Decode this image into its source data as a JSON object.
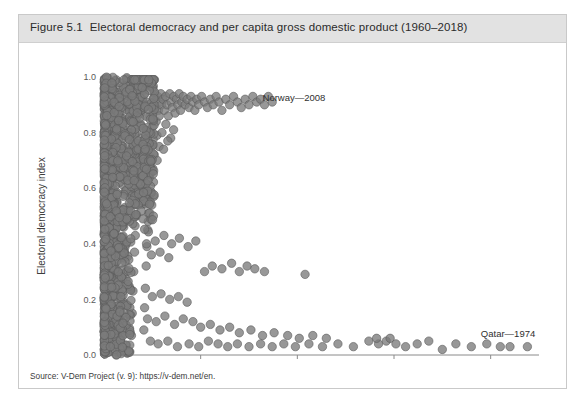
{
  "figure": {
    "number": "Figure 5.1",
    "title": "Electoral democracy and per capita gross domestic product (1960–2018)",
    "source": "Source: V-Dem Project (v. 9): https://v-dem.net/en."
  },
  "colors": {
    "header_band": "#e2e2e2",
    "frame_border": "#c9c9c9",
    "marker_fill": "#7b7b7b",
    "marker_stroke": "#5a5a5a",
    "axis": "#8a8a8a",
    "tick_text": "#595959"
  },
  "chart_data": {
    "type": "scatter",
    "title": "Electoral democracy and per capita gross domestic product (1960–2018)",
    "xlabel": "GDP per capita",
    "ylabel": "Electoral democracy index",
    "xlim": [
      0,
      225000
    ],
    "ylim": [
      0.0,
      1.0
    ],
    "xticks": [
      0,
      50000,
      100000,
      150000,
      200000
    ],
    "xtick_labels": [
      "0",
      "50,000",
      "100,000",
      "150,000",
      "200,000"
    ],
    "yticks": [
      0.0,
      0.2,
      0.4,
      0.6,
      0.8,
      1.0
    ],
    "ytick_labels": [
      "0.0",
      "0.2",
      "0.4",
      "0.6",
      "0.8",
      "1.0"
    ],
    "grid": false,
    "legend": null,
    "marker_radius_px": 4.2,
    "marker_opacity": 0.78,
    "annotations": [
      {
        "text": "Norway—2008",
        "x": 82000,
        "y": 0.925,
        "anchor": "start"
      },
      {
        "text": "Qatar—1974",
        "x": 209000,
        "y": 0.075,
        "anchor": "middle"
      }
    ],
    "points": [
      [
        1200,
        0.04
      ],
      [
        900,
        0.08
      ],
      [
        1500,
        0.12
      ],
      [
        800,
        0.16
      ],
      [
        2100,
        0.06
      ],
      [
        1700,
        0.21
      ],
      [
        1100,
        0.27
      ],
      [
        2400,
        0.33
      ],
      [
        600,
        0.38
      ],
      [
        1900,
        0.44
      ],
      [
        1300,
        0.49
      ],
      [
        2600,
        0.55
      ],
      [
        1000,
        0.61
      ],
      [
        2200,
        0.66
      ],
      [
        1600,
        0.72
      ],
      [
        3000,
        0.77
      ],
      [
        700,
        0.83
      ],
      [
        2800,
        0.88
      ],
      [
        1400,
        0.92
      ],
      [
        2000,
        0.95
      ],
      [
        3400,
        0.1
      ],
      [
        3800,
        0.18
      ],
      [
        4200,
        0.25
      ],
      [
        3600,
        0.31
      ],
      [
        4600,
        0.36
      ],
      [
        3200,
        0.42
      ],
      [
        5000,
        0.47
      ],
      [
        4400,
        0.52
      ],
      [
        5400,
        0.58
      ],
      [
        4000,
        0.63
      ],
      [
        5800,
        0.68
      ],
      [
        4800,
        0.74
      ],
      [
        6200,
        0.79
      ],
      [
        5200,
        0.84
      ],
      [
        6600,
        0.89
      ],
      [
        5600,
        0.93
      ],
      [
        7000,
        0.96
      ],
      [
        6000,
        0.9
      ],
      [
        7400,
        0.86
      ],
      [
        6400,
        0.81
      ],
      [
        7800,
        0.05
      ],
      [
        8200,
        0.13
      ],
      [
        8600,
        0.2
      ],
      [
        9000,
        0.28
      ],
      [
        9400,
        0.35
      ],
      [
        9800,
        0.41
      ],
      [
        10200,
        0.46
      ],
      [
        10600,
        0.53
      ],
      [
        11000,
        0.59
      ],
      [
        11400,
        0.64
      ],
      [
        11800,
        0.7
      ],
      [
        12200,
        0.75
      ],
      [
        12600,
        0.8
      ],
      [
        13000,
        0.85
      ],
      [
        13400,
        0.9
      ],
      [
        13800,
        0.94
      ],
      [
        14200,
        0.07
      ],
      [
        14600,
        0.15
      ],
      [
        15000,
        0.23
      ],
      [
        15400,
        0.3
      ],
      [
        15800,
        0.37
      ],
      [
        16200,
        0.43
      ],
      [
        16600,
        0.5
      ],
      [
        17000,
        0.56
      ],
      [
        17400,
        0.62
      ],
      [
        17800,
        0.67
      ],
      [
        18200,
        0.73
      ],
      [
        18600,
        0.78
      ],
      [
        19000,
        0.83
      ],
      [
        19400,
        0.88
      ],
      [
        19800,
        0.92
      ],
      [
        20200,
        0.95
      ],
      [
        20600,
        0.09
      ],
      [
        21000,
        0.17
      ],
      [
        21400,
        0.24
      ],
      [
        21800,
        0.32
      ],
      [
        22200,
        0.39
      ],
      [
        22600,
        0.45
      ],
      [
        23000,
        0.51
      ],
      [
        23400,
        0.57
      ],
      [
        23800,
        0.65
      ],
      [
        24200,
        0.71
      ],
      [
        24600,
        0.76
      ],
      [
        25000,
        0.82
      ],
      [
        25400,
        0.87
      ],
      [
        25800,
        0.91
      ],
      [
        26200,
        0.94
      ],
      [
        26600,
        0.89
      ],
      [
        27000,
        0.84
      ],
      [
        27400,
        0.79
      ],
      [
        27800,
        0.93
      ],
      [
        28200,
        0.88
      ],
      [
        28600,
        0.86
      ],
      [
        29000,
        0.91
      ],
      [
        29400,
        0.94
      ],
      [
        29800,
        0.9
      ],
      [
        30500,
        0.92
      ],
      [
        31200,
        0.88
      ],
      [
        31900,
        0.93
      ],
      [
        32600,
        0.9
      ],
      [
        33300,
        0.86
      ],
      [
        34000,
        0.94
      ],
      [
        34700,
        0.91
      ],
      [
        35400,
        0.89
      ],
      [
        36100,
        0.93
      ],
      [
        36800,
        0.87
      ],
      [
        37500,
        0.92
      ],
      [
        38200,
        0.9
      ],
      [
        38900,
        0.94
      ],
      [
        39600,
        0.88
      ],
      [
        40300,
        0.91
      ],
      [
        41000,
        0.93
      ],
      [
        42000,
        0.9
      ],
      [
        43000,
        0.92
      ],
      [
        44000,
        0.89
      ],
      [
        45000,
        0.93
      ],
      [
        46000,
        0.91
      ],
      [
        47000,
        0.88
      ],
      [
        48000,
        0.92
      ],
      [
        49000,
        0.9
      ],
      [
        50500,
        0.93
      ],
      [
        52000,
        0.91
      ],
      [
        53500,
        0.89
      ],
      [
        55000,
        0.92
      ],
      [
        56500,
        0.9
      ],
      [
        58000,
        0.93
      ],
      [
        59500,
        0.91
      ],
      [
        61000,
        0.88
      ],
      [
        63000,
        0.92
      ],
      [
        65000,
        0.9
      ],
      [
        67000,
        0.93
      ],
      [
        69000,
        0.91
      ],
      [
        71000,
        0.89
      ],
      [
        73000,
        0.92
      ],
      [
        75000,
        0.9
      ],
      [
        77000,
        0.93
      ],
      [
        79000,
        0.91
      ],
      [
        81000,
        0.92
      ],
      [
        83000,
        0.9
      ],
      [
        85000,
        0.93
      ],
      [
        87000,
        0.91
      ],
      [
        30000,
        0.8
      ],
      [
        32000,
        0.83
      ],
      [
        34500,
        0.78
      ],
      [
        36000,
        0.81
      ],
      [
        28500,
        0.75
      ],
      [
        26000,
        0.72
      ],
      [
        24000,
        0.68
      ],
      [
        27500,
        0.7
      ],
      [
        30800,
        0.74
      ],
      [
        33000,
        0.77
      ],
      [
        22000,
        0.4
      ],
      [
        26500,
        0.41
      ],
      [
        31000,
        0.43
      ],
      [
        35000,
        0.4
      ],
      [
        39000,
        0.42
      ],
      [
        43500,
        0.39
      ],
      [
        47500,
        0.41
      ],
      [
        24500,
        0.36
      ],
      [
        29000,
        0.37
      ],
      [
        33500,
        0.35
      ],
      [
        52000,
        0.3
      ],
      [
        56000,
        0.32
      ],
      [
        61000,
        0.31
      ],
      [
        66000,
        0.33
      ],
      [
        70000,
        0.3
      ],
      [
        74000,
        0.32
      ],
      [
        78000,
        0.31
      ],
      [
        83000,
        0.3
      ],
      [
        104000,
        0.29
      ],
      [
        25000,
        0.21
      ],
      [
        29500,
        0.22
      ],
      [
        34000,
        0.2
      ],
      [
        38500,
        0.21
      ],
      [
        43000,
        0.19
      ],
      [
        22500,
        0.13
      ],
      [
        27000,
        0.12
      ],
      [
        31500,
        0.14
      ],
      [
        36500,
        0.11
      ],
      [
        41000,
        0.13
      ],
      [
        46000,
        0.12
      ],
      [
        50000,
        0.1
      ],
      [
        55000,
        0.11
      ],
      [
        60000,
        0.09
      ],
      [
        65000,
        0.1
      ],
      [
        70000,
        0.08
      ],
      [
        76000,
        0.09
      ],
      [
        82000,
        0.07
      ],
      [
        88000,
        0.08
      ],
      [
        95000,
        0.07
      ],
      [
        101000,
        0.06
      ],
      [
        108000,
        0.07
      ],
      [
        115000,
        0.06
      ],
      [
        24000,
        0.05
      ],
      [
        28000,
        0.04
      ],
      [
        33000,
        0.05
      ],
      [
        38000,
        0.03
      ],
      [
        44000,
        0.04
      ],
      [
        49000,
        0.03
      ],
      [
        54000,
        0.05
      ],
      [
        59000,
        0.04
      ],
      [
        64000,
        0.03
      ],
      [
        69000,
        0.04
      ],
      [
        75000,
        0.03
      ],
      [
        81000,
        0.04
      ],
      [
        87000,
        0.03
      ],
      [
        93000,
        0.04
      ],
      [
        99000,
        0.03
      ],
      [
        106000,
        0.04
      ],
      [
        113000,
        0.03
      ],
      [
        121000,
        0.04
      ],
      [
        129000,
        0.03
      ],
      [
        137000,
        0.05
      ],
      [
        142000,
        0.04
      ],
      [
        146000,
        0.05
      ],
      [
        151000,
        0.04
      ],
      [
        156000,
        0.03
      ],
      [
        162000,
        0.04
      ],
      [
        168000,
        0.05
      ],
      [
        175000,
        0.02
      ],
      [
        182000,
        0.04
      ],
      [
        190000,
        0.03
      ],
      [
        198000,
        0.04
      ],
      [
        205000,
        0.03
      ],
      [
        210000,
        0.03
      ],
      [
        219000,
        0.03
      ],
      [
        141000,
        0.06
      ],
      [
        148000,
        0.06
      ]
    ]
  }
}
